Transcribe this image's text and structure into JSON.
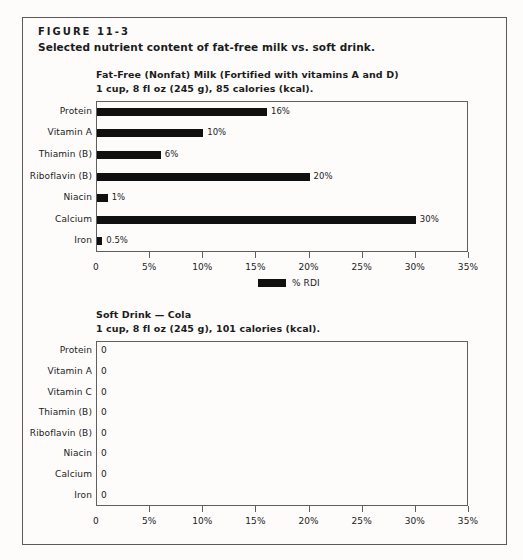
{
  "figure": {
    "number": "FIGURE 11-3",
    "caption": "Selected nutrient content of fat-free milk vs. soft drink."
  },
  "legend": {
    "label": "% RDI",
    "swatch_color": "#101010"
  },
  "colors": {
    "bar": "#101010",
    "frame": "#5a5a5a",
    "axis": "#5f5f5f",
    "text": "#1b1b1b",
    "page_background": "#fdfcfb"
  },
  "chart_data": [
    {
      "type": "bar",
      "orientation": "horizontal",
      "title": "Fat-Free (Nonfat) Milk (Fortified with vitamins A and D)",
      "subtitle": "1 cup, 8 fl oz (245 g), 85 calories (kcal).",
      "xlabel": "",
      "ylabel": "",
      "categories": [
        "Protein",
        "Vitamin A",
        "Thiamin (B)",
        "Riboflavin (B)",
        "Niacin",
        "Calcium",
        "Iron"
      ],
      "values": [
        16,
        10,
        6,
        20,
        1,
        30,
        0.5
      ],
      "data_labels": [
        "16%",
        "10%",
        "6%",
        "20%",
        "1%",
        "30%",
        "0.5%"
      ],
      "xlim": [
        0,
        35
      ],
      "xticks": [
        0,
        5,
        10,
        15,
        20,
        25,
        30,
        35
      ],
      "xticklabels": [
        "0",
        "5%",
        "10%",
        "15%",
        "20%",
        "25%",
        "30%",
        "35%"
      ],
      "grid": false,
      "legend": [
        "% RDI"
      ],
      "legend_position": "bottom-center"
    },
    {
      "type": "bar",
      "orientation": "horizontal",
      "title": "Soft Drink — Cola",
      "subtitle": "1 cup, 8 fl oz (245 g), 101 calories (kcal).",
      "xlabel": "",
      "ylabel": "",
      "categories": [
        "Protein",
        "Vitamin A",
        "Vitamin C",
        "Thiamin (B)",
        "Riboflavin (B)",
        "Niacin",
        "Calcium",
        "Iron"
      ],
      "values": [
        0,
        0,
        0,
        0,
        0,
        0,
        0,
        0
      ],
      "data_labels": [
        "0",
        "0",
        "0",
        "0",
        "0",
        "0",
        "0",
        "0"
      ],
      "xlim": [
        0,
        35
      ],
      "xticks": [
        0,
        5,
        10,
        15,
        20,
        25,
        30,
        35
      ],
      "xticklabels": [
        "0",
        "5%",
        "10%",
        "15%",
        "20%",
        "25%",
        "30%",
        "35%"
      ],
      "grid": false,
      "legend": [],
      "legend_position": "none"
    }
  ]
}
